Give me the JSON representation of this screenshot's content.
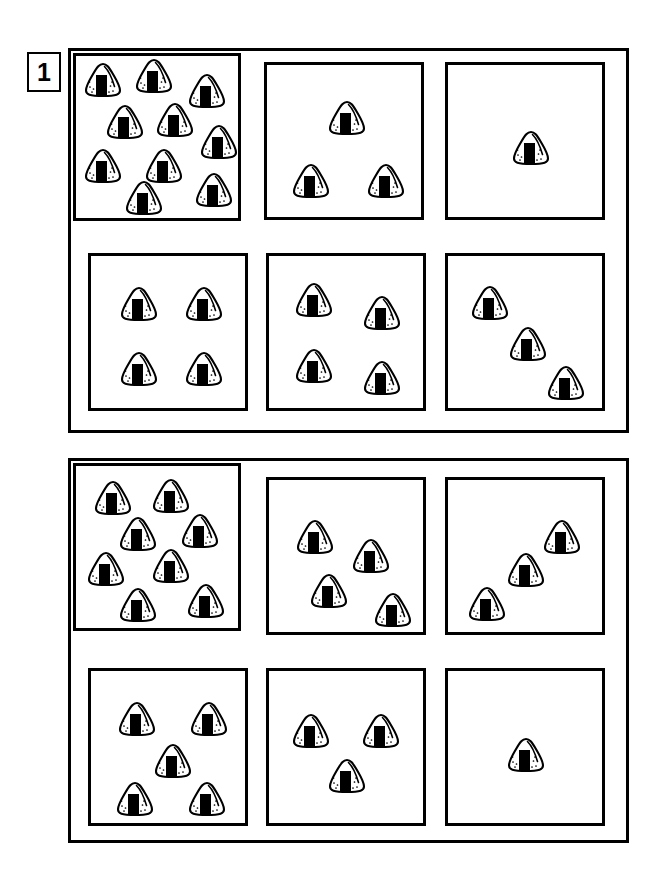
{
  "worksheet": {
    "exercise_number": "1",
    "item_icon": "onigiri-icon",
    "icon_label": "rice ball"
  },
  "groups": [
    {
      "name": "group-1",
      "frame": {
        "x": 68,
        "y": 48,
        "w": 561,
        "h": 385
      },
      "cells": [
        {
          "name": "cell-1",
          "count": 10,
          "overlap": true,
          "box": {
            "x": 73,
            "y": 53,
            "w": 168,
            "h": 168
          },
          "items": [
            {
              "x": 27,
              "y": 24
            },
            {
              "x": 78,
              "y": 20
            },
            {
              "x": 131,
              "y": 35
            },
            {
              "x": 49,
              "y": 66
            },
            {
              "x": 99,
              "y": 64
            },
            {
              "x": 143,
              "y": 86
            },
            {
              "x": 27,
              "y": 110
            },
            {
              "x": 88,
              "y": 110
            },
            {
              "x": 138,
              "y": 134
            },
            {
              "x": 68,
              "y": 142
            }
          ]
        },
        {
          "name": "cell-2",
          "count": 3,
          "overlap": false,
          "box": {
            "x": 264,
            "y": 62,
            "w": 160,
            "h": 158
          },
          "items": [
            {
              "x": 80,
              "y": 53
            },
            {
              "x": 44,
              "y": 116
            },
            {
              "x": 119,
              "y": 116
            }
          ]
        },
        {
          "name": "cell-3",
          "count": 1,
          "overlap": false,
          "box": {
            "x": 445,
            "y": 62,
            "w": 160,
            "h": 158
          },
          "items": [
            {
              "x": 83,
              "y": 83
            }
          ]
        },
        {
          "name": "cell-4",
          "count": 4,
          "overlap": false,
          "box": {
            "x": 88,
            "y": 253,
            "w": 160,
            "h": 158
          },
          "items": [
            {
              "x": 48,
              "y": 48
            },
            {
              "x": 113,
              "y": 48
            },
            {
              "x": 48,
              "y": 113
            },
            {
              "x": 113,
              "y": 113
            }
          ]
        },
        {
          "name": "cell-5",
          "count": 4,
          "overlap": false,
          "box": {
            "x": 266,
            "y": 253,
            "w": 160,
            "h": 158
          },
          "items": [
            {
              "x": 45,
              "y": 44
            },
            {
              "x": 113,
              "y": 57
            },
            {
              "x": 45,
              "y": 110
            },
            {
              "x": 113,
              "y": 122
            }
          ]
        },
        {
          "name": "cell-6",
          "count": 3,
          "overlap": false,
          "box": {
            "x": 445,
            "y": 253,
            "w": 160,
            "h": 158
          },
          "items": [
            {
              "x": 42,
              "y": 47
            },
            {
              "x": 80,
              "y": 88
            },
            {
              "x": 118,
              "y": 127
            }
          ]
        }
      ]
    },
    {
      "name": "group-2",
      "frame": {
        "x": 68,
        "y": 458,
        "w": 561,
        "h": 385
      },
      "cells": [
        {
          "name": "cell-7",
          "count": 8,
          "overlap": true,
          "box": {
            "x": 73,
            "y": 463,
            "w": 168,
            "h": 168
          },
          "items": [
            {
              "x": 37,
              "y": 32
            },
            {
              "x": 95,
              "y": 30
            },
            {
              "x": 62,
              "y": 68
            },
            {
              "x": 124,
              "y": 65
            },
            {
              "x": 30,
              "y": 103
            },
            {
              "x": 95,
              "y": 100
            },
            {
              "x": 62,
              "y": 139
            },
            {
              "x": 130,
              "y": 135
            }
          ]
        },
        {
          "name": "cell-8",
          "count": 4,
          "overlap": false,
          "box": {
            "x": 266,
            "y": 477,
            "w": 160,
            "h": 158
          },
          "items": [
            {
              "x": 46,
              "y": 57
            },
            {
              "x": 102,
              "y": 76
            },
            {
              "x": 60,
              "y": 111
            },
            {
              "x": 124,
              "y": 130
            }
          ]
        },
        {
          "name": "cell-9",
          "count": 3,
          "overlap": false,
          "box": {
            "x": 445,
            "y": 477,
            "w": 160,
            "h": 158
          },
          "items": [
            {
              "x": 114,
              "y": 57
            },
            {
              "x": 78,
              "y": 90
            },
            {
              "x": 39,
              "y": 124
            }
          ]
        },
        {
          "name": "cell-10",
          "count": 5,
          "overlap": false,
          "box": {
            "x": 88,
            "y": 668,
            "w": 160,
            "h": 158
          },
          "items": [
            {
              "x": 46,
              "y": 48
            },
            {
              "x": 118,
              "y": 48
            },
            {
              "x": 82,
              "y": 90
            },
            {
              "x": 44,
              "y": 128
            },
            {
              "x": 116,
              "y": 128
            }
          ]
        },
        {
          "name": "cell-11",
          "count": 3,
          "overlap": false,
          "box": {
            "x": 266,
            "y": 668,
            "w": 160,
            "h": 158
          },
          "items": [
            {
              "x": 42,
              "y": 60
            },
            {
              "x": 112,
              "y": 60
            },
            {
              "x": 78,
              "y": 105
            }
          ]
        },
        {
          "name": "cell-12",
          "count": 1,
          "overlap": false,
          "box": {
            "x": 445,
            "y": 668,
            "w": 160,
            "h": 158
          },
          "items": [
            {
              "x": 78,
              "y": 84
            }
          ]
        }
      ]
    }
  ],
  "colors": {
    "ink": "#000000",
    "paper": "#ffffff",
    "nori": "#000000"
  }
}
